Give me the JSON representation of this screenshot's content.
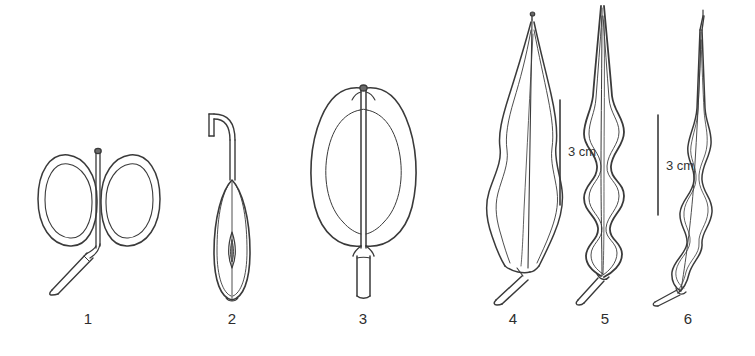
{
  "plate": {
    "background_color": "#ffffff",
    "ink_color": "#3a3a3a",
    "width": 755,
    "height": 356,
    "type": "line-drawing-plate",
    "subject": "fruit and pod morphology"
  },
  "figures": [
    {
      "id": 1,
      "caption": "1",
      "caption_x": 88,
      "caption_y": 310,
      "description": "paired oval lobed fruit with central style and oblique stalk"
    },
    {
      "id": 2,
      "caption": "2",
      "caption_x": 232,
      "caption_y": 310,
      "description": "narrow obovoid pod with hooked stalk and single lens-shaped seed"
    },
    {
      "id": 3,
      "caption": "3",
      "caption_x": 363,
      "caption_y": 310,
      "description": "broad two-lobed pod with central septum and stout stalk"
    },
    {
      "id": 4,
      "caption": "4",
      "caption_x": 513,
      "caption_y": 310,
      "description": "lanceolate pod with undulate margins and short stalk"
    },
    {
      "id": 5,
      "caption": "5",
      "caption_x": 605,
      "caption_y": 310,
      "description": "long moniliform pod with strongly undulate margins"
    },
    {
      "id": 6,
      "caption": "6",
      "caption_x": 688,
      "caption_y": 310,
      "description": "slender curved pod with undulate margins"
    }
  ],
  "scale_bars": [
    {
      "id": "scale-bar-left",
      "label": "3 cm",
      "line_x": 560,
      "line_top": 100,
      "line_bottom": 205,
      "label_x": 568,
      "label_y": 144
    },
    {
      "id": "scale-bar-right",
      "label": "3 cm",
      "line_x": 658,
      "line_top": 115,
      "line_bottom": 215,
      "label_x": 666,
      "label_y": 158
    }
  ]
}
